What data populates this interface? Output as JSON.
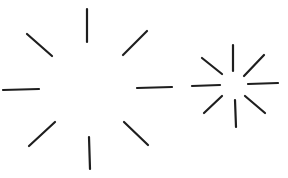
{
  "figure": {
    "description": "Two starburst figures drawn with eight short radiating strokes each",
    "stroke_color": "#1e1e1e",
    "background_color": "#ffffff",
    "bursts": [
      {
        "name": "large-burst",
        "center": [
          87,
          88
        ],
        "stroke_width": 2.2,
        "rays": [
          {
            "dir": "N",
            "x1": 87,
            "y1": 9,
            "x2": 87,
            "y2": 42
          },
          {
            "dir": "NE",
            "x1": 123,
            "y1": 55,
            "x2": 147,
            "y2": 31
          },
          {
            "dir": "E",
            "x1": 137,
            "y1": 88,
            "x2": 172,
            "y2": 87
          },
          {
            "dir": "SE",
            "x1": 124,
            "y1": 122,
            "x2": 148,
            "y2": 145
          },
          {
            "dir": "S",
            "x1": 89,
            "y1": 137,
            "x2": 90,
            "y2": 169
          },
          {
            "dir": "SW",
            "x1": 29,
            "y1": 146,
            "x2": 55,
            "y2": 122
          },
          {
            "dir": "W",
            "x1": 3,
            "y1": 90,
            "x2": 39,
            "y2": 89
          },
          {
            "dir": "NW",
            "x1": 27,
            "y1": 34,
            "x2": 52,
            "y2": 56
          }
        ]
      },
      {
        "name": "small-burst",
        "center": [
          234,
          85
        ],
        "stroke_width": 2.2,
        "rays": [
          {
            "dir": "N",
            "x1": 233,
            "y1": 45,
            "x2": 233,
            "y2": 71
          },
          {
            "dir": "NE",
            "x1": 244,
            "y1": 76,
            "x2": 264,
            "y2": 55
          },
          {
            "dir": "E",
            "x1": 248,
            "y1": 84,
            "x2": 278,
            "y2": 83
          },
          {
            "dir": "SE",
            "x1": 245,
            "y1": 96,
            "x2": 265,
            "y2": 113
          },
          {
            "dir": "S",
            "x1": 235,
            "y1": 100,
            "x2": 236,
            "y2": 127
          },
          {
            "dir": "SW",
            "x1": 204,
            "y1": 113,
            "x2": 222,
            "y2": 96
          },
          {
            "dir": "W",
            "x1": 192,
            "y1": 86,
            "x2": 220,
            "y2": 85
          },
          {
            "dir": "NW",
            "x1": 202,
            "y1": 58,
            "x2": 222,
            "y2": 74
          }
        ]
      }
    ]
  }
}
